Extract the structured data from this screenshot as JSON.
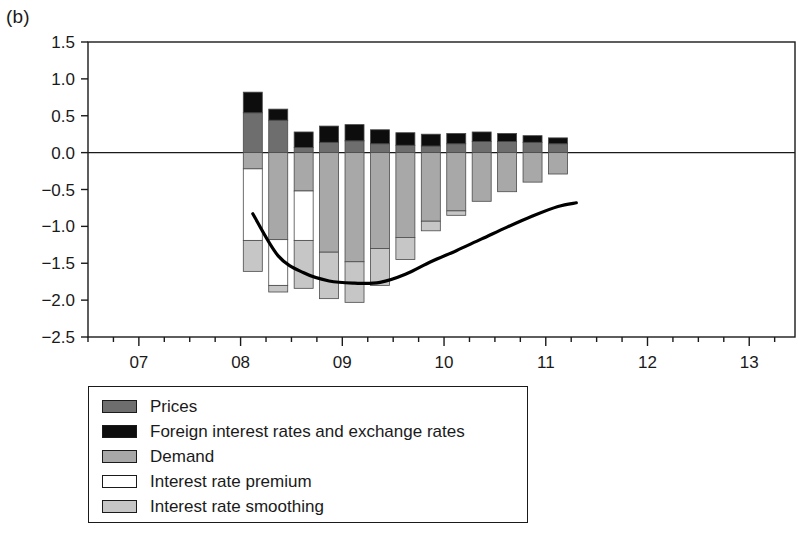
{
  "panel": {
    "label": "(b)"
  },
  "colors": {
    "prices": "#6e6e6e",
    "foreign": "#0d0d0d",
    "demand": "#a8a8a8",
    "premium": "#ffffff",
    "smoothing": "#c6c6c6",
    "line": "#000000",
    "axis": "#1a1a1a"
  },
  "legend": {
    "items": [
      {
        "label": "Prices",
        "key": "prices",
        "swatch": "#6e6e6e"
      },
      {
        "label": "Foreign interest rates and exchange rates",
        "key": "foreign",
        "swatch": "#0d0d0d"
      },
      {
        "label": "Demand",
        "key": "demand",
        "swatch": "#a8a8a8"
      },
      {
        "label": "Interest rate premium",
        "key": "premium",
        "swatch": "#ffffff"
      },
      {
        "label": "Interest rate smoothing",
        "key": "smoothing",
        "swatch": "#c6c6c6"
      }
    ]
  },
  "chart_data": {
    "type": "bar",
    "subtype": "stacked-bar-with-line",
    "title": "",
    "xlabel": "",
    "ylabel": "",
    "ylim": [
      -2.5,
      1.5
    ],
    "ytick_labels": [
      "1.5",
      "1.0",
      "0.5",
      "0.0",
      "-0.5",
      "-1.0",
      "-1.5",
      "-2.0",
      "-2.5"
    ],
    "ytick_values": [
      1.5,
      1.0,
      0.5,
      0.0,
      -0.5,
      -1.0,
      -1.5,
      -2.0,
      -2.5
    ],
    "xlim": [
      2006.5,
      2013.45
    ],
    "xtick_labels": [
      "07",
      "08",
      "09",
      "10",
      "11",
      "12",
      "13"
    ],
    "xtick_values": [
      2007,
      2008,
      2009,
      2010,
      2011,
      2012,
      2013
    ],
    "minor_ticks_per_year": 4,
    "grid": false,
    "zero_line": true,
    "legend_position": "below-left",
    "categories": [
      "08Q1",
      "08Q2",
      "08Q3",
      "08Q4",
      "09Q1",
      "09Q2",
      "09Q3",
      "09Q4",
      "10Q1",
      "10Q2",
      "10Q3",
      "10Q4",
      "11Q1"
    ],
    "x": [
      2008.12,
      2008.37,
      2008.62,
      2008.87,
      2009.12,
      2009.37,
      2009.62,
      2009.87,
      2010.12,
      2010.37,
      2010.62,
      2010.87,
      2011.12
    ],
    "series": [
      {
        "name": "Prices",
        "key": "prices",
        "color": "#6e6e6e",
        "values": [
          0.54,
          0.44,
          0.07,
          0.14,
          0.16,
          0.12,
          0.1,
          0.09,
          0.12,
          0.15,
          0.15,
          0.14,
          0.12
        ]
      },
      {
        "name": "Foreign interest rates and exchange rates",
        "key": "foreign",
        "color": "#0d0d0d",
        "values": [
          0.28,
          0.15,
          0.21,
          0.22,
          0.22,
          0.19,
          0.17,
          0.16,
          0.14,
          0.13,
          0.11,
          0.09,
          0.08
        ]
      },
      {
        "name": "Demand",
        "key": "demand",
        "color": "#a8a8a8",
        "values": [
          -0.22,
          -1.18,
          -0.52,
          -1.35,
          -1.48,
          -1.3,
          -1.15,
          -0.93,
          -0.79,
          -0.66,
          -0.53,
          -0.4,
          -0.29
        ]
      },
      {
        "name": "Interest rate premium",
        "key": "premium",
        "color": "#ffffff",
        "values": [
          -0.97,
          -0.62,
          -0.67,
          0.0,
          0.0,
          0.0,
          0.0,
          0.0,
          0.0,
          0.0,
          0.0,
          0.0,
          0.0
        ]
      },
      {
        "name": "Interest rate smoothing",
        "key": "smoothing",
        "color": "#c6c6c6",
        "values": [
          -0.42,
          -0.09,
          -0.65,
          -0.63,
          -0.55,
          -0.5,
          -0.3,
          -0.13,
          -0.06,
          0.0,
          0.0,
          0.0,
          0.0
        ]
      }
    ],
    "line_series": {
      "name": "Total",
      "color": "#000000",
      "x": [
        2008.12,
        2008.37,
        2008.62,
        2008.87,
        2009.12,
        2009.37,
        2009.62,
        2009.87,
        2010.12,
        2010.37,
        2010.62,
        2010.87,
        2011.12,
        2011.3
      ],
      "values": [
        -0.83,
        -1.4,
        -1.63,
        -1.74,
        -1.77,
        -1.76,
        -1.65,
        -1.48,
        -1.33,
        -1.17,
        -1.01,
        -0.86,
        -0.73,
        -0.68
      ]
    }
  }
}
